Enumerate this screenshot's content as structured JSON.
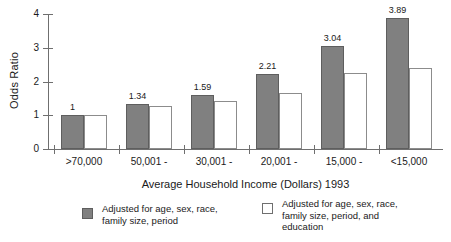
{
  "chart_data": {
    "type": "bar",
    "title": "",
    "xlabel": "Average  Household Income (Dollars) 1993",
    "ylabel": "Odds Ratio",
    "ylim": [
      0,
      4
    ],
    "yticks": [
      "0",
      "1",
      "2",
      "3",
      "4"
    ],
    "grid": false,
    "legend_position": "bottom",
    "categories": [
      ">70,000",
      "50,001 -",
      "30,001 -",
      "20,001 -",
      "15,000 -",
      "<15,000"
    ],
    "series": [
      {
        "name": "Adjusted for age, sex, race,\nfamily size, period",
        "swatch": "filled",
        "color": "#808080",
        "values": [
          1,
          1.34,
          1.59,
          2.21,
          3.04,
          3.89
        ],
        "labels": [
          "1",
          "1.34",
          "1.59",
          "2.21",
          "3.04",
          "3.89"
        ]
      },
      {
        "name": "Adjusted for age, sex, race,\nfamily size, period, and\neducation",
        "swatch": "hollow",
        "color": "#ffffff",
        "values": [
          1.0,
          1.28,
          1.43,
          1.67,
          2.26,
          2.41
        ],
        "labels": [
          "",
          "",
          "",
          "",
          "",
          ""
        ]
      }
    ]
  },
  "colors": {
    "series_filled": "#808080",
    "series_hollow": "#ffffff",
    "axis": "#6f6f6f",
    "text": "#1a1a1a",
    "background": "#ffffff"
  }
}
